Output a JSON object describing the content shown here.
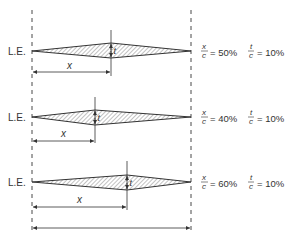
{
  "diagram": {
    "title": "",
    "leading_edge_label": "L.E.",
    "x_label": "x",
    "t_label": "t",
    "colors": {
      "line": "#333333",
      "hatch": "#555555",
      "background": "#ffffff"
    },
    "rows": [
      {
        "le_label": "L.E.",
        "x_over_c_label": "x",
        "x_over_c_den": "c",
        "x_over_c_value": "= 50%",
        "t_over_c_label": "t",
        "t_over_c_den": "c",
        "t_over_c_value": "= 10%",
        "max_thickness_position_pct": 50,
        "thickness_pct": 10
      },
      {
        "le_label": "L.E.",
        "x_over_c_label": "x",
        "x_over_c_den": "c",
        "x_over_c_value": "= 40%",
        "t_over_c_label": "t",
        "t_over_c_den": "c",
        "t_over_c_value": "= 10%",
        "max_thickness_position_pct": 40,
        "thickness_pct": 10
      },
      {
        "le_label": "L.E.",
        "x_over_c_label": "x",
        "x_over_c_den": "c",
        "x_over_c_value": "= 60%",
        "t_over_c_label": "t",
        "t_over_c_den": "c",
        "t_over_c_value": "= 10%",
        "max_thickness_position_pct": 60,
        "thickness_pct": 10
      }
    ]
  }
}
